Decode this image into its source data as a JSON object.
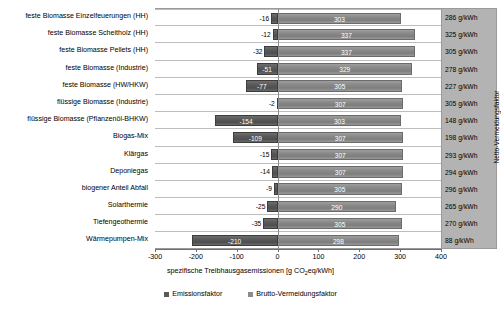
{
  "chart_data": {
    "type": "bar",
    "orientation": "horizontal",
    "stacked_diverging": true,
    "title": "",
    "xlabel": "spezifische Treibhausgasemissionen [g CO2eq/kWh]",
    "ylabel": "",
    "xlim": [
      -300,
      400
    ],
    "xticks": [
      -300,
      -200,
      -100,
      0,
      100,
      200,
      300,
      400
    ],
    "xtick_labels": [
      "-300",
      "-200",
      "-100",
      "0",
      "100",
      "200",
      "300",
      "400"
    ],
    "grid": true,
    "legend_position": "bottom",
    "legend": [
      "Emissionsfaktor",
      "Brutto-Vermeidungsfaktor"
    ],
    "categories": [
      "feste Biomasse Einzelfeuerungen (HH)",
      "feste Biomasse Scheitholz (HH)",
      "feste Biomasse Pellets (HH)",
      "feste Biomasse (Industrie)",
      "feste Biomasse (HW/HKW)",
      "flüssige Biomasse (Industrie)",
      "flüssige Biomasse (Pflanzenöl-BHKW)",
      "Biogas-Mix",
      "Klärgas",
      "Deponiegas",
      "biogener Anteil Abfall",
      "Solarthermie",
      "Tiefengeothermie",
      "Wärmepumpen-Mix"
    ],
    "series": [
      {
        "name": "Emissionsfaktor",
        "color": "#595959",
        "values": [
          -16,
          -12,
          -32,
          -51,
          -77,
          -2,
          -154,
          -109,
          -15,
          -14,
          -9,
          -25,
          -35,
          -210
        ]
      },
      {
        "name": "Brutto-Vermeidungsfaktor",
        "color": "#8c8c8c",
        "values": [
          303,
          337,
          337,
          329,
          305,
          307,
          303,
          307,
          307,
          307,
          305,
          290,
          305,
          298
        ]
      }
    ],
    "right_column": {
      "axis_title": "Netto-Vermeidungsfaktor",
      "unit": "g/kWh",
      "values": [
        "286 g/kWh",
        "325 g/kWh",
        "305 g/kWh",
        "278 g/kWh",
        "227 g/kWh",
        "305 g/kWh",
        "148 g/kWh",
        "198 g/kWh",
        "293 g/kWh",
        "294 g/kWh",
        "296 g/kWh",
        "265 g/kWh",
        "270 g/kWh",
        "88 g/kWh"
      ]
    }
  }
}
